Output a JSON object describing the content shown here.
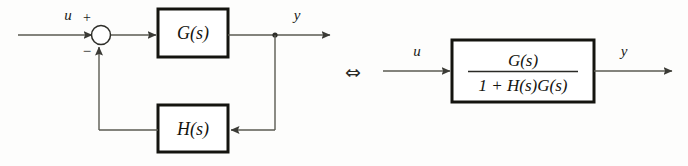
{
  "figure": {
    "kind": "control-system-block-diagram",
    "background_color": "#fdfdfc",
    "line_color": "#4a4a44",
    "box_border_color": "#14140f",
    "text_color": "#1a1a18"
  },
  "left_diagram": {
    "input_label": "u",
    "output_label": "y",
    "summing_junction": {
      "name": "summing-junction",
      "positive_sign": "+",
      "negative_sign": "−"
    },
    "forward_block": {
      "label": "G(s)",
      "base": "G",
      "arg": "(s)"
    },
    "feedback_block": {
      "label": "H(s)",
      "base": "H",
      "arg": "(s)"
    },
    "branch_point": "branch-node"
  },
  "equivalence": {
    "symbol": "⇔",
    "meaning": "is equivalent to"
  },
  "right_diagram": {
    "input_label": "u",
    "output_label": "y",
    "transfer_block": {
      "numerator": "G(s)",
      "denominator": "1 + H(s)G(s)",
      "numerator_parts": {
        "base": "G",
        "arg": "(s)"
      },
      "denominator_parts": {
        "one": "1",
        "plus": "+",
        "h_base": "H",
        "h_arg": "(s)",
        "g_base": "G",
        "g_arg": "(s)"
      }
    }
  }
}
